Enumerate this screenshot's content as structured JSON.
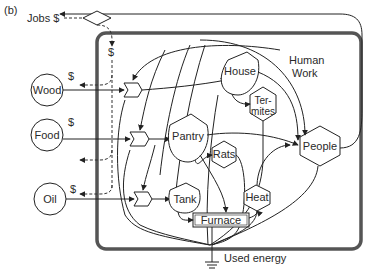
{
  "figure_label": "(b)",
  "system": {
    "boundary_label": "Human Work system boundary",
    "border_color": "#555555"
  },
  "sources": [
    {
      "id": "wood",
      "label": "Wood",
      "money": "$"
    },
    {
      "id": "food",
      "label": "Food",
      "money": "$"
    },
    {
      "id": "oil",
      "label": "Oil",
      "money": "$"
    }
  ],
  "jobs": {
    "label": "Jobs $",
    "money_in": "$"
  },
  "storages": [
    {
      "id": "house",
      "label": "House"
    },
    {
      "id": "pantry",
      "label": "Pantry"
    },
    {
      "id": "tank",
      "label": "Tank"
    }
  ],
  "consumers": [
    {
      "id": "termites",
      "label_line1": "Ter-",
      "label_line2": "mites"
    },
    {
      "id": "rats",
      "label": "Rats"
    },
    {
      "id": "heat",
      "label": "Heat"
    },
    {
      "id": "people",
      "label": "People"
    }
  ],
  "process": {
    "id": "furnace",
    "label": "Furnace"
  },
  "annotations": {
    "human_work_line1": "Human",
    "human_work_line2": "Work",
    "used_energy": "Used energy"
  },
  "colors": {
    "line": "#222222",
    "text": "#2a2a2a",
    "background": "#ffffff"
  }
}
